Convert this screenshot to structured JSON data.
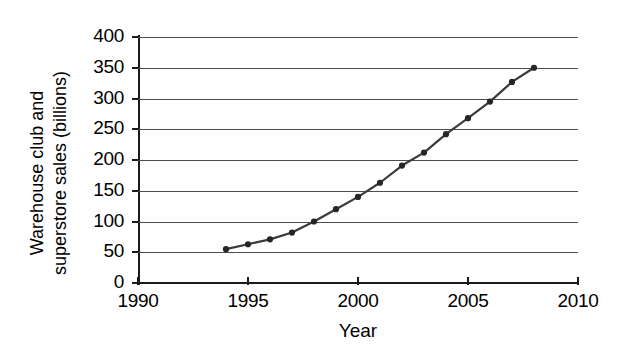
{
  "chart_data": {
    "type": "line",
    "title": "",
    "xlabel": "Year",
    "ylabel": "Warehouse club and superstore sales (billions)",
    "ylabel_line1": "Warehouse club and",
    "ylabel_line2": "superstore sales (billions)",
    "xlim": [
      1990,
      2010
    ],
    "ylim": [
      0,
      400
    ],
    "grid": true,
    "legend": "none",
    "x_tick_labels": [
      "1990",
      "1995",
      "2000",
      "2005",
      "2010"
    ],
    "x_tick_values": [
      1990,
      1995,
      2000,
      2005,
      2010
    ],
    "y_tick_labels": [
      "0",
      "50",
      "100",
      "150",
      "200",
      "250",
      "300",
      "350",
      "400"
    ],
    "y_tick_values": [
      0,
      50,
      100,
      150,
      200,
      250,
      300,
      350,
      400
    ],
    "marker": "filled-circle",
    "line_color": "#3a3a3a",
    "marker_color": "#262626",
    "grid_color": "#4d4d4d",
    "axis_color": "#1a1a1a",
    "background_color": "#ffffff",
    "x": [
      1994,
      1995,
      1996,
      1997,
      1998,
      1999,
      2000,
      2001,
      2002,
      2003,
      2004,
      2005,
      2006,
      2007,
      2008
    ],
    "values": [
      55,
      63,
      71,
      82,
      100,
      120,
      140,
      163,
      191,
      212,
      242,
      268,
      295,
      327,
      350
    ],
    "series": [
      {
        "name": "Warehouse club and superstore sales",
        "values": [
          55,
          63,
          71,
          82,
          100,
          120,
          140,
          163,
          191,
          212,
          242,
          268,
          295,
          327,
          350
        ]
      }
    ]
  }
}
